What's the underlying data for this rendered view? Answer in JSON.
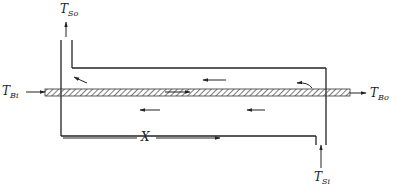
{
  "diagram": {
    "labels": {
      "shell_out": {
        "T": "T",
        "sub": "So"
      },
      "shell_in": {
        "T": "T",
        "sub": "Si"
      },
      "body_in": {
        "T": "T",
        "sub": "Bi"
      },
      "body_out": {
        "T": "T",
        "sub": "Bo"
      },
      "axis": "X"
    },
    "colors": {
      "line": "#222222",
      "hatch": "#444444",
      "background": "#ffffff"
    }
  }
}
